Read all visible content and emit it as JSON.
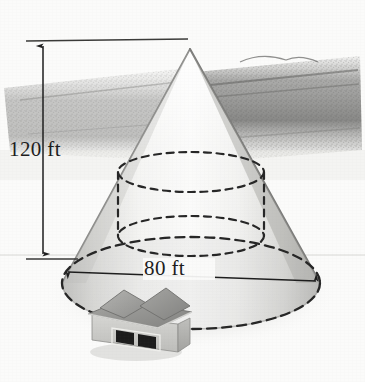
{
  "figure": {
    "background_color": "#fbfbfa",
    "ink_color": "#1d1d1d"
  },
  "dimensions": {
    "height": {
      "label": "120 ft",
      "value": 120,
      "unit": "ft",
      "orientation": "vertical",
      "arrow_style": "double-headed"
    },
    "diameter": {
      "label": "80 ft",
      "value": 80,
      "unit": "ft",
      "orientation": "horizontal",
      "arrow_style": "double-headed"
    }
  },
  "shapes": {
    "cone": {
      "name": "cone",
      "apex": {
        "x": 190,
        "y": 48
      },
      "base_center": {
        "x": 191,
        "y": 283
      },
      "base_rx": 129,
      "base_ry": 46,
      "fill": "#f1f1ef",
      "stroke": "#9a9a98"
    },
    "cylinder": {
      "name": "inscribed-cylinder",
      "line_style": "dashed",
      "top_ellipse": {
        "cx": 191,
        "cy": 172,
        "rx": 73,
        "ry": 20
      },
      "bottom_ellipse": {
        "cx": 191,
        "cy": 236,
        "rx": 73,
        "ry": 20
      },
      "left_edge_x": 118,
      "right_edge_x": 264,
      "stroke": "#262626"
    }
  },
  "scene": {
    "landscape": {
      "name": "landscape-hedgerow",
      "description": "dark smudged band of trees and fields behind the cone",
      "color": "#6f6f6d"
    },
    "house": {
      "name": "house",
      "description": "small gray house with hip roof and two dark windows, placed inside the cone base for scale",
      "roof_color": "#9a9a98",
      "wall_color": "#c9c9c6",
      "window_color": "#1c1c1c",
      "position": {
        "x": 88,
        "y": 288,
        "width": 98,
        "height": 72
      }
    }
  }
}
